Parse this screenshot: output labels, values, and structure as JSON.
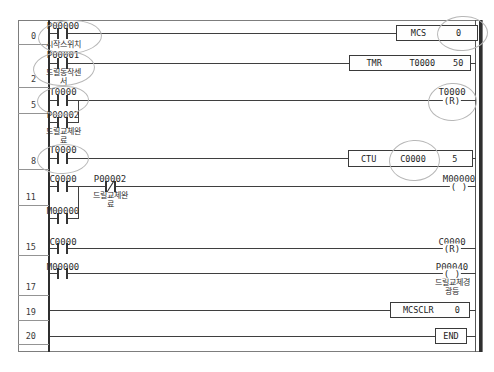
{
  "colors": {
    "wire": "#3f3f3f",
    "frame_border": "#7d7d7d",
    "annotation_circle": "#b7b7b7",
    "background": "#ffffff",
    "text": "#2b2b2b"
  },
  "rungs": [
    {
      "number": "0",
      "contacts": [
        {
          "device": "P00000",
          "type": "NO",
          "label_lines": [
            "시작스위치"
          ]
        }
      ],
      "box": {
        "cells": [
          "MCS",
          "0"
        ]
      }
    },
    {
      "number": "2",
      "contacts": [
        {
          "device": "P00001",
          "type": "NO",
          "label_lines": [
            "드릴동작센",
            "서"
          ]
        }
      ],
      "box": {
        "cells": [
          "TMR",
          "T0000",
          "50"
        ]
      }
    },
    {
      "number": "5",
      "contacts": [
        {
          "device": "T0000",
          "type": "NO"
        },
        {
          "device": "P00002",
          "type": "NO",
          "branch": true,
          "label_lines": [
            "드릴교체완",
            "료"
          ]
        }
      ],
      "coil": {
        "device": "T0000",
        "symbol": "(R)"
      }
    },
    {
      "number": "8",
      "contacts": [
        {
          "device": "T0000",
          "type": "NO"
        }
      ],
      "box": {
        "cells": [
          "CTU",
          "C0000",
          "5"
        ]
      }
    },
    {
      "number": "11",
      "contacts": [
        {
          "device": "C0000",
          "type": "NO"
        },
        {
          "device": "P00002",
          "type": "NC",
          "label_lines": [
            "드릴교체완",
            "료"
          ]
        },
        {
          "device": "M00000",
          "type": "NO",
          "branch": true
        }
      ],
      "coil": {
        "device": "M00000",
        "symbol": "( )"
      }
    },
    {
      "number": "15",
      "contacts": [
        {
          "device": "C0000",
          "type": "NO"
        }
      ],
      "coil": {
        "device": "C0000",
        "symbol": "(R)"
      }
    },
    {
      "number": "17",
      "contacts": [
        {
          "device": "M00000",
          "type": "NO"
        }
      ],
      "coil": {
        "device": "P00040",
        "symbol": "( )",
        "label_lines": [
          "드릴교체경",
          "광등"
        ]
      }
    },
    {
      "number": "19",
      "box": {
        "cells": [
          "MCSCLR",
          "0"
        ]
      }
    },
    {
      "number": "20",
      "box": {
        "cells": [
          "END"
        ]
      }
    }
  ],
  "annotations": {
    "circled_elements": [
      "P00000 contact",
      "P00001 contact",
      "T0000 contact rung 5",
      "T0000 contact rung 8",
      "MCS operand 0",
      "T0000 reset coil",
      "CTU counter C0000"
    ]
  }
}
